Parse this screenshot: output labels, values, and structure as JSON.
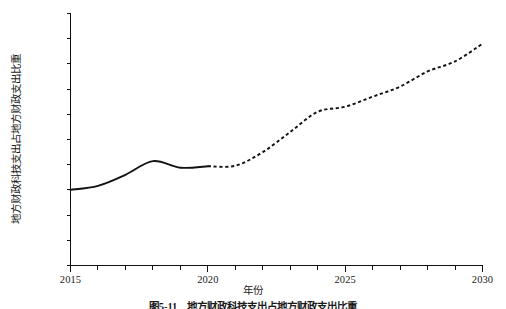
{
  "figure": {
    "xlabel": "年份",
    "ylabel": "地方财政科技支出占地方财政支出比重",
    "caption": "图5-11　地方财政科技支出占地方财政支出比重"
  },
  "chart_data": {
    "type": "line",
    "title": "",
    "subtitle": "",
    "xlabel": "年份",
    "ylabel": "地方财政科技支出占地方财政支出比重",
    "xlim": [
      2015,
      2030
    ],
    "ylim": [
      0,
      5.0
    ],
    "grid": false,
    "legend_position": "none",
    "y_unit": "%",
    "x_tick_labels": [
      "2015",
      "2020",
      "2025",
      "2030"
    ],
    "x_major_ticks": [
      2015,
      2020,
      2025,
      2030
    ],
    "x_minor_ticks": [
      2016,
      2017,
      2018,
      2019,
      2021,
      2022,
      2023,
      2024,
      2026,
      2027,
      2028,
      2029
    ],
    "y_tick_labels": [
      "0",
      "0.5%",
      "1.0%",
      "1.5%",
      "2.0%",
      "2.5%",
      "3.0%",
      "3.5%",
      "4.0%",
      "4.5%",
      "5.0%"
    ],
    "y_ticks": [
      0,
      0.5,
      1.0,
      1.5,
      2.0,
      2.5,
      3.0,
      3.5,
      4.0,
      4.5,
      5.0
    ],
    "x": [
      2015,
      2016,
      2017,
      2018,
      2019,
      2020,
      2021,
      2022,
      2023,
      2024,
      2025,
      2026,
      2027,
      2028,
      2029,
      2030
    ],
    "series": [
      {
        "name": "实际值",
        "style": "solid",
        "x": [
          2015,
          2016,
          2017,
          2018,
          2019,
          2020
        ],
        "values": [
          1.5,
          1.58,
          1.8,
          2.07,
          1.94,
          1.97
        ]
      },
      {
        "name": "预测值",
        "style": "dashed",
        "x": [
          2020,
          2021,
          2022,
          2023,
          2024,
          2025,
          2026,
          2027,
          2028,
          2029,
          2030
        ],
        "values": [
          1.97,
          1.98,
          2.25,
          2.65,
          3.05,
          3.15,
          3.35,
          3.55,
          3.85,
          4.05,
          4.4
        ]
      }
    ],
    "colors": {
      "line": "#111111",
      "axis": "#111111",
      "background": "#ffffff"
    }
  }
}
